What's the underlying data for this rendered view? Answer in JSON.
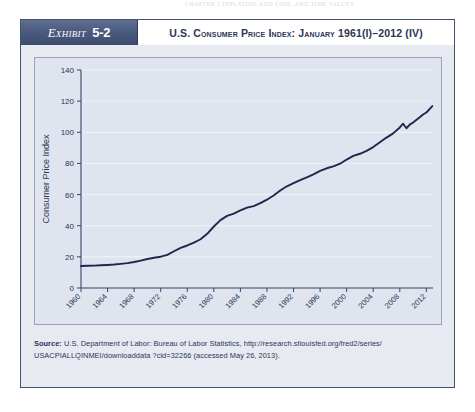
{
  "running_head": "CHAPTER 5      INFLATION AND TIME, AND TIME VALUES",
  "exhibit": {
    "tag_word": "Exhibit",
    "tag_number": "5-2",
    "title": "U.S. Consumer Price Index: January 1961(I)–2012 (IV)"
  },
  "source": {
    "label": "Source:",
    "text": " U.S. Department of Labor: Bureau of Labor Statistics, http://research.stlouisfed.org/fred2/series/ USACPIALLQINMEI/downloaddata ?cid=32266 (accessed May 26, 2013)."
  },
  "colors": {
    "header_band": "#4b5b80",
    "frame_border": "#43506e",
    "panel_bg": "#e7eaf1",
    "plot_bg": "#dfe4ee",
    "series_line": "#21264f",
    "grid": "#f2f5fa",
    "text": "#2b3654"
  },
  "chart_data": {
    "type": "line",
    "title": "U.S. Consumer Price Index: January 1961(I)–2012 (IV)",
    "xlabel": "",
    "ylabel": "Consumer Price Index",
    "xlim": [
      1960,
      2013
    ],
    "ylim": [
      0,
      140
    ],
    "ytick_values": [
      0,
      20,
      40,
      60,
      80,
      100,
      120,
      140
    ],
    "ytick_labels": [
      "0",
      "20",
      "40",
      "60",
      "80",
      "100",
      "120",
      "140"
    ],
    "xtick_values": [
      1960,
      1964,
      1968,
      1972,
      1976,
      1980,
      1984,
      1988,
      1992,
      1996,
      2000,
      2004,
      2008,
      2012
    ],
    "xtick_labels": [
      "1960",
      "1964",
      "1968",
      "1972",
      "1976",
      "1980",
      "1984",
      "1988",
      "1992",
      "1996",
      "2000",
      "2004",
      "2008",
      "2012"
    ],
    "xtick_rotation": 45,
    "grid": true,
    "legend": false,
    "series": [
      {
        "name": "Consumer Price Index",
        "x": [
          1960,
          1961,
          1962,
          1963,
          1964,
          1965,
          1966,
          1967,
          1968,
          1969,
          1970,
          1971,
          1972,
          1973,
          1974,
          1975,
          1976,
          1977,
          1978,
          1979,
          1980,
          1981,
          1982,
          1983,
          1984,
          1985,
          1986,
          1987,
          1988,
          1989,
          1990,
          1991,
          1992,
          1993,
          1994,
          1995,
          1996,
          1997,
          1998,
          1999,
          2000,
          2001,
          2002,
          2003,
          2004,
          2005,
          2006,
          2007,
          2008,
          2008.5,
          2009,
          2009.5,
          2010,
          2011,
          2011.5,
          2012,
          2012.9
        ],
        "y": [
          14.1,
          14.3,
          14.4,
          14.6,
          14.8,
          15.1,
          15.5,
          16.0,
          16.7,
          17.6,
          18.6,
          19.4,
          20.1,
          21.3,
          23.6,
          25.8,
          27.3,
          29.1,
          31.3,
          34.8,
          39.5,
          43.6,
          46.3,
          47.8,
          49.8,
          51.6,
          52.6,
          54.5,
          56.7,
          59.4,
          62.6,
          65.3,
          67.3,
          69.3,
          71.1,
          73.0,
          75.2,
          76.9,
          78.1,
          79.8,
          82.5,
          84.8,
          86.2,
          88.1,
          90.5,
          93.6,
          96.6,
          99.3,
          103.1,
          105.5,
          102.6,
          104.9,
          106.3,
          109.7,
          111.4,
          112.7,
          116.8
        ]
      }
    ],
    "annotations": []
  }
}
